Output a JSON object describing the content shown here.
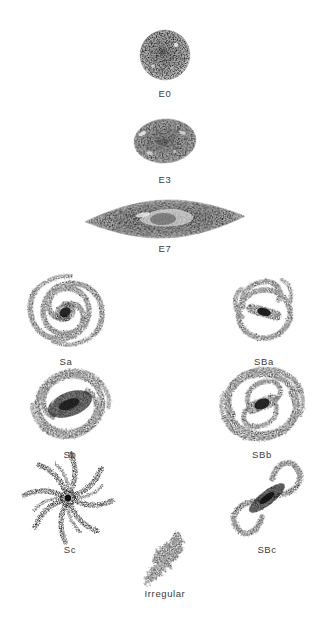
{
  "figure": {
    "background_color": "#ffffff",
    "ink_color": "#3b3b3b"
  },
  "galaxies": [
    {
      "id": "E0",
      "label": "E0",
      "class": "elliptical",
      "branch": "stem",
      "description": "round stippled elliptical galaxy",
      "ellipticity": 0.0
    },
    {
      "id": "E3",
      "label": "E3",
      "class": "elliptical",
      "branch": "stem",
      "description": "moderately flattened stippled elliptical galaxy",
      "ellipticity": 0.3
    },
    {
      "id": "E7",
      "label": "E7",
      "class": "elliptical",
      "branch": "stem",
      "description": "highly flattened lens-shaped elliptical galaxy seen edge-on",
      "ellipticity": 0.7
    },
    {
      "id": "Sa",
      "label": "Sa",
      "class": "normal-spiral",
      "branch": "left",
      "description": "spiral with large bulge and tightly wound arms"
    },
    {
      "id": "Sb",
      "label": "Sb",
      "class": "normal-spiral",
      "branch": "left",
      "description": "spiral with intermediate bulge and moderately wound arms"
    },
    {
      "id": "Sc",
      "label": "Sc",
      "class": "normal-spiral",
      "branch": "left",
      "description": "spiral with small nucleus and many loosely wound open arms"
    },
    {
      "id": "SBa",
      "label": "SBa",
      "class": "barred-spiral",
      "branch": "right",
      "description": "barred spiral with tightly wound arms forming a ring"
    },
    {
      "id": "SBb",
      "label": "SBb",
      "class": "barred-spiral",
      "branch": "right",
      "description": "barred spiral with moderately wound arms"
    },
    {
      "id": "SBc",
      "label": "SBc",
      "class": "barred-spiral",
      "branch": "right",
      "description": "barred spiral with prominent bar and two loose S-shaped arms"
    },
    {
      "id": "Irregular",
      "label": "Irregular",
      "class": "irregular",
      "branch": "bottom",
      "description": "clumpy asymmetric irregular galaxy"
    }
  ]
}
